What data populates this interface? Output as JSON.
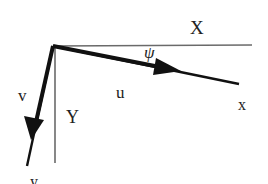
{
  "diagram": {
    "colors": {
      "thin_axis": "#6a6a6a",
      "thick_axis": "#111111",
      "text": "#222222",
      "background": "#ffffff"
    },
    "labels": {
      "X": "X",
      "Y": "Y",
      "x": "x",
      "y": "y",
      "u": "u",
      "v": "v",
      "psi": "ψ"
    },
    "elements": [
      {
        "id": "X-axis",
        "type": "line",
        "style": "thin",
        "from": [
          53,
          46
        ],
        "to": [
          252,
          45
        ]
      },
      {
        "id": "Y-axis",
        "type": "line",
        "style": "thin",
        "from": [
          55,
          47
        ],
        "to": [
          55,
          163
        ]
      },
      {
        "id": "x-axis",
        "type": "line",
        "style": "thick",
        "from": [
          53,
          46
        ],
        "to": [
          239,
          84
        ],
        "arrow_at": [
          178,
          70
        ],
        "arrow_label": "u"
      },
      {
        "id": "y-axis",
        "type": "line",
        "style": "thick",
        "from": [
          53,
          46
        ],
        "to": [
          27,
          166
        ],
        "arrow_at": [
          33,
          136
        ],
        "arrow_label": "v"
      }
    ]
  }
}
